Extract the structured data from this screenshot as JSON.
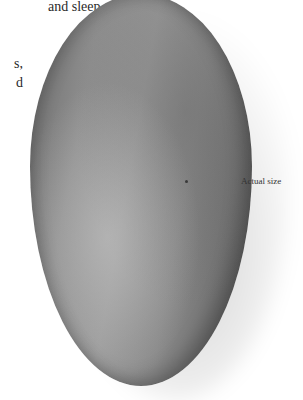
{
  "body_text": {
    "fragments": [
      "and sleep",
      "s,",
      "d"
    ]
  },
  "figure": {
    "caption": "Actual size",
    "colors": {
      "shell_dark": "#5e5e5e",
      "shell_mid": "#8e8e8e",
      "shell_light": "#a8a8a8",
      "background": "#ffffff"
    }
  }
}
